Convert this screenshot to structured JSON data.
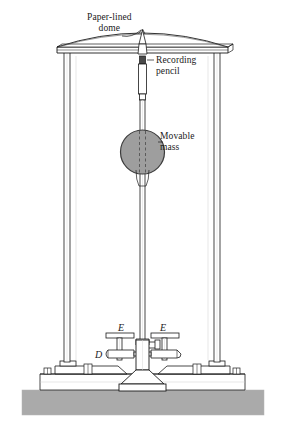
{
  "figure": {
    "width": 285,
    "height": 432,
    "background_color": "#ffffff"
  },
  "labels": {
    "dome": "Paper-lined\ndome",
    "dome_line1": "Paper-lined",
    "dome_line2": "dome",
    "pencil_line1": "Recording",
    "pencil_line2": "pencil",
    "mass_line1": "Movable",
    "mass_line2": "mass",
    "e_left": "E",
    "e_right": "E",
    "d": "D"
  },
  "colors": {
    "line": "#1a1a1a",
    "mass_fill": "#9e9e9e",
    "mass_stroke": "#3c3c3c",
    "ground_fill": "#aaaaaa",
    "frame_fill": "#ffffff",
    "shade": "#d8d8d8"
  },
  "parts": {
    "dome": "paper-lined-dome",
    "top_rail": "top-rail",
    "left_column": "left-column",
    "right_column": "right-column",
    "recording_pencil": "recording-pencil",
    "pendulum_rod": "pendulum-rod",
    "movable_mass": "movable-mass",
    "spring_assembly_left": "spring-assembly-left",
    "spring_assembly_right": "spring-assembly-right",
    "damper": "damper-d",
    "pedestal": "central-pedestal",
    "base_plate": "base-plate",
    "ground": "ground-foundation"
  }
}
